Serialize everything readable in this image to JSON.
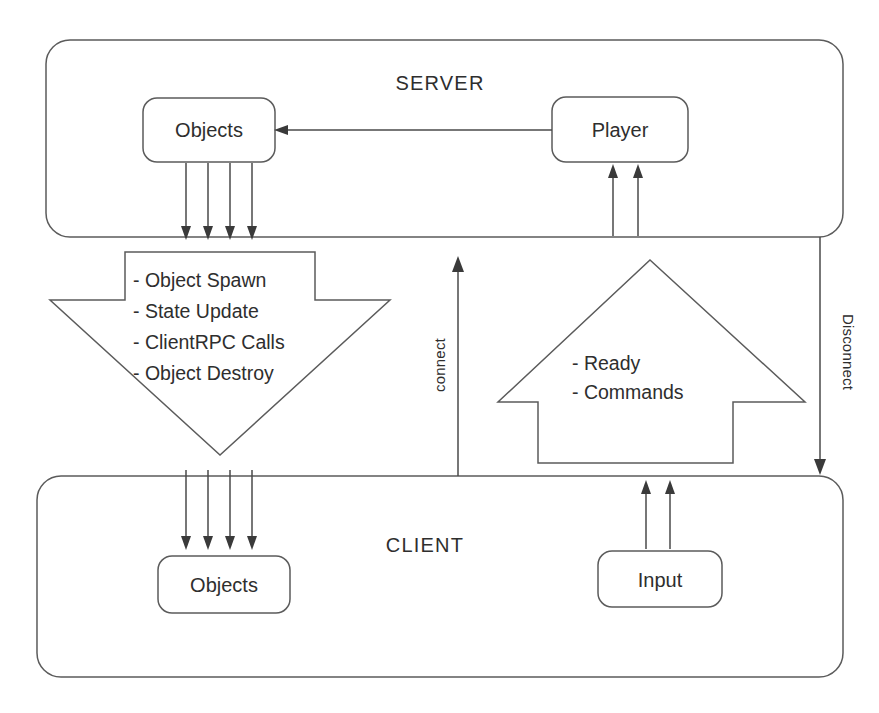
{
  "diagram": {
    "zones": [
      {
        "id": "server",
        "label": "SERVER"
      },
      {
        "id": "client",
        "label": "CLIENT"
      }
    ],
    "nodes": [
      {
        "id": "server-objects",
        "label": "Objects",
        "zone": "server"
      },
      {
        "id": "server-player",
        "label": "Player",
        "zone": "server"
      },
      {
        "id": "client-objects",
        "label": "Objects",
        "zone": "client"
      },
      {
        "id": "client-input",
        "label": "Input",
        "zone": "client"
      }
    ],
    "down_arrow": {
      "direction": "down",
      "from": "server",
      "to": "client",
      "items": [
        "- Object Spawn",
        "- State Update",
        "- ClientRPC Calls",
        "- Object Destroy"
      ]
    },
    "up_arrow": {
      "direction": "up",
      "from": "client",
      "to": "server",
      "items": [
        "- Ready",
        "- Commands"
      ]
    },
    "edge_labels": [
      {
        "id": "connect",
        "label": "connect",
        "direction": "up",
        "orientation": "vertical-bottom-to-top"
      },
      {
        "id": "disconnect",
        "label": "Disconnect",
        "direction": "down",
        "orientation": "vertical-top-to-bottom"
      }
    ],
    "colors": {
      "stroke": "#5b5b5b",
      "text": "#2e2e2e",
      "background": "#ffffff",
      "arrow_head": "#3a3a3a"
    }
  }
}
